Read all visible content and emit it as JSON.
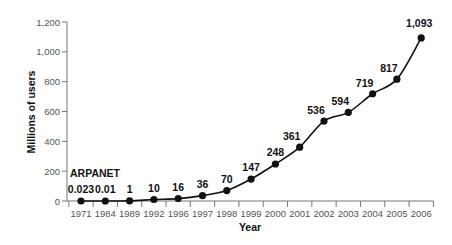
{
  "chart_data": {
    "type": "line",
    "title": "",
    "xlabel": "Year",
    "ylabel": "Millions of users",
    "categories": [
      "1971",
      "1984",
      "1989",
      "1992",
      "1996",
      "1997",
      "1998",
      "1999",
      "2000",
      "2001",
      "2002",
      "2003",
      "2004",
      "2005",
      "2006"
    ],
    "values": [
      0.023,
      0.01,
      1,
      10,
      16,
      36,
      70,
      147,
      248,
      361,
      536,
      594,
      719,
      817,
      1093
    ],
    "data_labels": [
      "0.023",
      "0.01",
      "1",
      "10",
      "16",
      "36",
      "70",
      "147",
      "248",
      "361",
      "536",
      "594",
      "719",
      "817",
      "1,093"
    ],
    "ylim": [
      0,
      1200
    ],
    "yticks": [
      0,
      200,
      400,
      600,
      800,
      1000,
      1200
    ],
    "ytick_labels": [
      "0",
      "200",
      "400",
      "600",
      "800",
      "1,000",
      "1,200"
    ],
    "grid": false,
    "legend": null,
    "annotations": [
      {
        "text": "ARPANET",
        "at": "1971"
      }
    ],
    "colors": {
      "line": "#111111",
      "marker": "#111111",
      "axis": "#777777"
    }
  }
}
